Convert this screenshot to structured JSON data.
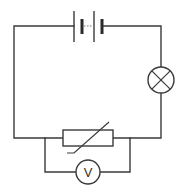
{
  "diagram": {
    "type": "circuit",
    "components": [
      {
        "id": "battery",
        "kind": "battery",
        "cells": 2,
        "position": "top"
      },
      {
        "id": "lamp",
        "kind": "lamp",
        "position": "right"
      },
      {
        "id": "thermistor",
        "kind": "thermistor",
        "position": "bottom"
      },
      {
        "id": "voltmeter",
        "kind": "voltmeter",
        "label": "V",
        "position": "bottom-parallel"
      }
    ],
    "connections": [
      "battery-lamp (series)",
      "lamp-thermistor (series)",
      "thermistor-battery (series)",
      "voltmeter parallel to thermistor"
    ],
    "colors": {
      "stroke": "#3a3a3a",
      "background": "#ffffff"
    }
  },
  "voltmeter": {
    "label": "V"
  }
}
